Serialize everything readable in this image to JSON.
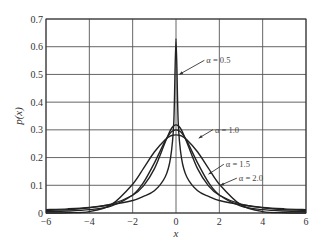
{
  "chart_data": {
    "type": "line",
    "title": "",
    "xlabel": "x",
    "ylabel": "p(x)",
    "xlim": [
      -6,
      6
    ],
    "ylim": [
      0,
      0.7
    ],
    "xticks": [
      -6,
      -4,
      -2,
      0,
      2,
      4,
      6
    ],
    "xtick_labels": [
      "−6",
      "−4",
      "−2",
      "0",
      "2",
      "4",
      "6"
    ],
    "yticks": [
      0,
      0.1,
      0.2,
      0.3,
      0.4,
      0.5,
      0.6,
      0.7
    ],
    "ytick_labels": [
      "0",
      "0.1",
      "0.2",
      "0.3",
      "0.4",
      "0.5",
      "0.6",
      "0.7"
    ],
    "grid": true,
    "legend": "none (inline annotations with arrows)",
    "x": [
      -6,
      -5,
      -4,
      -3,
      -2,
      -1.5,
      -1,
      -0.5,
      -0.25,
      -0.1,
      0,
      0.1,
      0.25,
      0.5,
      1,
      1.5,
      2,
      3,
      4,
      5,
      6
    ],
    "series": [
      {
        "name": "α = 0.5",
        "values": [
          0.012,
          0.015,
          0.02,
          0.03,
          0.045,
          0.06,
          0.08,
          0.13,
          0.2,
          0.33,
          0.63,
          0.33,
          0.2,
          0.13,
          0.08,
          0.06,
          0.045,
          0.03,
          0.02,
          0.015,
          0.012
        ]
      },
      {
        "name": "α = 1.0",
        "values": [
          0.009,
          0.012,
          0.019,
          0.032,
          0.064,
          0.098,
          0.159,
          0.255,
          0.3,
          0.315,
          0.318,
          0.315,
          0.3,
          0.255,
          0.159,
          0.098,
          0.064,
          0.032,
          0.019,
          0.012,
          0.009
        ]
      },
      {
        "name": "α = 1.5",
        "values": [
          0.005,
          0.007,
          0.012,
          0.025,
          0.065,
          0.11,
          0.18,
          0.26,
          0.29,
          0.298,
          0.3,
          0.298,
          0.29,
          0.26,
          0.18,
          0.11,
          0.065,
          0.025,
          0.012,
          0.007,
          0.005
        ]
      },
      {
        "name": "α = 2.0",
        "values": [
          0.0,
          0.001,
          0.005,
          0.029,
          0.104,
          0.161,
          0.22,
          0.264,
          0.278,
          0.281,
          0.282,
          0.281,
          0.278,
          0.264,
          0.22,
          0.161,
          0.104,
          0.029,
          0.005,
          0.001,
          0.0
        ]
      }
    ],
    "annotations": [
      {
        "text": "α = 0.5",
        "text_x": 1.4,
        "text_y": 0.54,
        "arrow_to_x": 0.15,
        "arrow_to_y": 0.5
      },
      {
        "text": "α = 1.0",
        "text_x": 1.8,
        "text_y": 0.29,
        "arrow_to_x": 1.05,
        "arrow_to_y": 0.27
      },
      {
        "text": "α = 1.5",
        "text_x": 2.3,
        "text_y": 0.165,
        "arrow_to_x": 1.5,
        "arrow_to_y": 0.14
      },
      {
        "text": "α = 2.0",
        "text_x": 2.9,
        "text_y": 0.115,
        "arrow_to_x": 2.05,
        "arrow_to_y": 0.1
      }
    ]
  }
}
